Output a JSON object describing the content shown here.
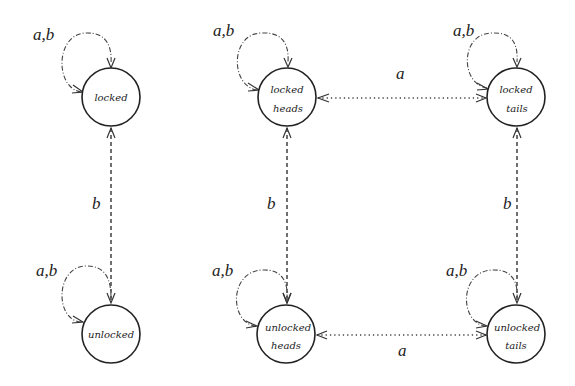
{
  "diagram": {
    "type": "state-machine",
    "left_machine": {
      "states": [
        {
          "id": "locked",
          "lines": [
            "locked"
          ]
        },
        {
          "id": "unlocked",
          "lines": [
            "unlocked"
          ]
        }
      ],
      "self_loop_label": "a,b",
      "transitions": [
        {
          "from": "locked",
          "to": "unlocked",
          "label": "b",
          "bidirectional": true,
          "style": "dashed"
        }
      ]
    },
    "right_machine": {
      "states": [
        {
          "id": "locked_heads",
          "lines": [
            "locked",
            "heads"
          ]
        },
        {
          "id": "locked_tails",
          "lines": [
            "locked",
            "tails"
          ]
        },
        {
          "id": "unlocked_heads",
          "lines": [
            "unlocked",
            "heads"
          ]
        },
        {
          "id": "unlocked_tails",
          "lines": [
            "unlocked",
            "tails"
          ]
        }
      ],
      "self_loop_label": "a,b",
      "transitions": [
        {
          "from": "locked_heads",
          "to": "locked_tails",
          "label": "a",
          "bidirectional": true,
          "style": "dotted"
        },
        {
          "from": "unlocked_heads",
          "to": "unlocked_tails",
          "label": "a",
          "bidirectional": true,
          "style": "dotted"
        },
        {
          "from": "locked_heads",
          "to": "unlocked_heads",
          "label": "b",
          "bidirectional": true,
          "style": "dashed"
        },
        {
          "from": "locked_tails",
          "to": "unlocked_tails",
          "label": "b",
          "bidirectional": true,
          "style": "dashed"
        }
      ]
    },
    "labels": {
      "locked": "locked",
      "unlocked": "unlocked",
      "heads": "heads",
      "tails": "tails",
      "loop": "a,b",
      "a": "a",
      "b": "b"
    }
  }
}
